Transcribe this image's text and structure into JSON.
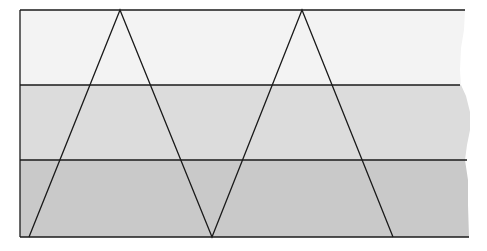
{
  "diagram": {
    "bands": [
      {
        "name": "top-band",
        "color": "#f3f3f3",
        "y0": 10,
        "y1": 85
      },
      {
        "name": "middle-band",
        "color": "#dcdcdc",
        "y0": 85,
        "y1": 160
      },
      {
        "name": "bottom-band",
        "color": "#c9c9c9",
        "y0": 160,
        "y1": 237
      }
    ],
    "line_color": "#1a1a1a",
    "zigzag_points": [
      [
        29,
        237
      ],
      [
        120,
        10
      ],
      [
        212,
        237
      ],
      [
        302,
        10
      ],
      [
        393,
        237
      ]
    ]
  }
}
